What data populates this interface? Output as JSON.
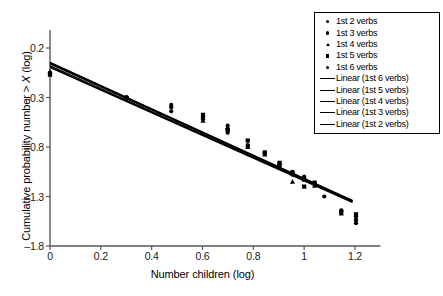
{
  "chart_data": {
    "type": "scatter",
    "title": "",
    "xlabel": "Number children (log)",
    "ylabel_prefix": "Cumulative probability number > ",
    "ylabel_italic": "X",
    "ylabel_suffix": " (log)",
    "xlim": [
      0,
      1.3
    ],
    "ylim": [
      -1.8,
      0.2
    ],
    "xticks": [
      "0",
      "0.2",
      "0.4",
      "0.6",
      "0.8",
      "1",
      "1.2"
    ],
    "xtick_values": [
      0,
      0.2,
      0.4,
      0.6,
      0.8,
      1,
      1.2
    ],
    "yticks": [
      "0.2",
      "–0.3",
      "–0.8",
      "–1.3",
      "–1.8"
    ],
    "ytick_values": [
      0.2,
      -0.3,
      -0.8,
      -1.3,
      -1.8
    ],
    "grid": false,
    "legend_position": "top-right",
    "series": [
      {
        "name": "1st 2 verbs",
        "marker": "circle",
        "points": [
          [
            0.0,
            -0.05
          ],
          [
            0.301,
            -0.3
          ],
          [
            0.477,
            -0.44
          ],
          [
            0.602,
            -0.52
          ],
          [
            0.699,
            -0.62
          ],
          [
            0.778,
            -0.78
          ],
          [
            0.845,
            -0.86
          ],
          [
            0.903,
            -0.97
          ],
          [
            0.954,
            -1.05
          ],
          [
            1.0,
            -1.1
          ],
          [
            1.041,
            -1.17
          ],
          [
            1.079,
            -1.3
          ],
          [
            1.146,
            -1.44
          ],
          [
            1.204,
            -1.57
          ]
        ]
      },
      {
        "name": "1st 3 verbs",
        "marker": "circle",
        "points": [
          [
            0.0,
            -0.06
          ],
          [
            0.301,
            -0.295
          ],
          [
            0.477,
            -0.375
          ],
          [
            0.602,
            -0.5
          ],
          [
            0.699,
            -0.655
          ],
          [
            0.778,
            -0.79
          ],
          [
            0.845,
            -0.87
          ],
          [
            0.903,
            -0.975
          ],
          [
            0.954,
            -1.07
          ],
          [
            1.0,
            -1.115
          ],
          [
            1.041,
            -1.175
          ],
          [
            1.146,
            -1.45
          ],
          [
            1.204,
            -1.5
          ]
        ]
      },
      {
        "name": "1st 4 verbs",
        "marker": "triangle",
        "points": [
          [
            0.0,
            -0.04
          ],
          [
            0.301,
            -0.3
          ],
          [
            0.602,
            -0.535
          ],
          [
            0.699,
            -0.6
          ],
          [
            0.778,
            -0.8
          ],
          [
            0.845,
            -0.875
          ],
          [
            0.903,
            -0.98
          ],
          [
            0.954,
            -1.15
          ],
          [
            1.0,
            -1.13
          ],
          [
            1.041,
            -1.19
          ],
          [
            1.146,
            -1.47
          ],
          [
            1.204,
            -1.51
          ]
        ]
      },
      {
        "name": "1st 5 verbs",
        "marker": "square",
        "points": [
          [
            0.0,
            -0.07
          ],
          [
            0.301,
            -0.305
          ],
          [
            0.602,
            -0.475
          ],
          [
            0.699,
            -0.63
          ],
          [
            0.778,
            -0.735
          ],
          [
            0.845,
            -0.855
          ],
          [
            0.903,
            -0.96
          ],
          [
            0.954,
            -1.06
          ],
          [
            1.0,
            -1.2
          ],
          [
            1.041,
            -1.16
          ],
          [
            1.146,
            -1.46
          ],
          [
            1.204,
            -1.48
          ]
        ]
      },
      {
        "name": "1st 6 verbs",
        "marker": "circle",
        "points": [
          [
            0.0,
            -0.05
          ],
          [
            0.301,
            -0.31
          ],
          [
            0.477,
            -0.4
          ],
          [
            0.602,
            -0.505
          ],
          [
            0.699,
            -0.585
          ],
          [
            0.778,
            -0.8
          ],
          [
            0.845,
            -0.865
          ],
          [
            0.903,
            -0.99
          ],
          [
            0.954,
            -1.08
          ],
          [
            1.0,
            -1.12
          ],
          [
            1.041,
            -1.18
          ],
          [
            1.204,
            -1.545
          ]
        ]
      }
    ],
    "trendlines": [
      {
        "name": "Linear (1st 6 verbs)",
        "intercept": 0.055,
        "slope": -1.175
      },
      {
        "name": "Linear (1st 5 verbs)",
        "intercept": 0.05,
        "slope": -1.17
      },
      {
        "name": "Linear (1st 4 verbs)",
        "intercept": 0.04,
        "slope": -1.165
      },
      {
        "name": "Linear (1st 3 verbs)",
        "intercept": 0.02,
        "slope": -1.155
      },
      {
        "name": "Linear (1st 2 verbs)",
        "intercept": 0.005,
        "slope": -1.145
      }
    ],
    "line_x_range": [
      0,
      1.19
    ]
  },
  "legend": {
    "items": [
      {
        "label": "1st 2 verbs",
        "key": "marker-circle-icon"
      },
      {
        "label": "1st 3 verbs",
        "key": "marker-circle-icon"
      },
      {
        "label": "1st 4 verbs",
        "key": "marker-triangle-icon"
      },
      {
        "label": "1st 5 verbs",
        "key": "marker-square-icon"
      },
      {
        "label": "1st 6 verbs",
        "key": "marker-circle-icon"
      },
      {
        "label": "Linear (1st 6 verbs)",
        "key": "trendline-icon"
      },
      {
        "label": "Linear (1st 5 verbs)",
        "key": "trendline-icon"
      },
      {
        "label": "Linear (1st 4 verbs)",
        "key": "trendline-icon"
      },
      {
        "label": "Linear (1st 3 verbs)",
        "key": "trendline-icon"
      },
      {
        "label": "Linear (1st 2 verbs)",
        "key": "trendline-icon"
      }
    ]
  },
  "colors": {
    "ink": "#000000",
    "axis": "#595959",
    "background": "#ffffff"
  }
}
